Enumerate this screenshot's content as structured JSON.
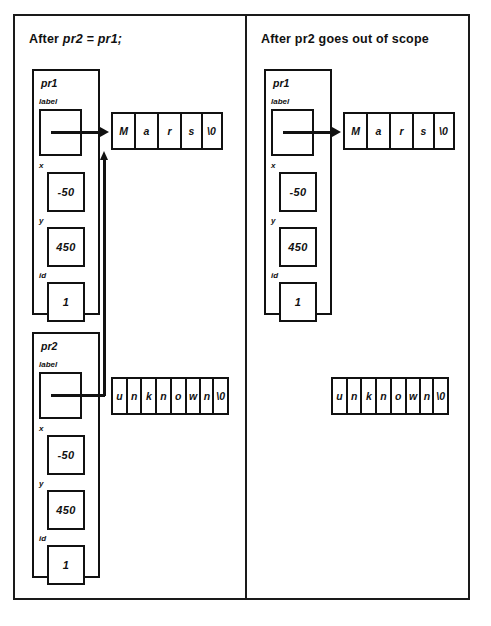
{
  "figure": {
    "type": "pointer-memory-diagram",
    "border_color": "#111111",
    "background": "#ffffff"
  },
  "panels": [
    {
      "id": "left",
      "title_prefix": "After ",
      "title_code": "pr2 = pr1;",
      "structs": [
        {
          "name": "pr1",
          "fields": [
            {
              "label": "label",
              "value": ""
            },
            {
              "label": "x",
              "value": "-50"
            },
            {
              "label": "y",
              "value": "450"
            },
            {
              "label": "id",
              "value": "1"
            }
          ]
        },
        {
          "name": "pr2",
          "fields": [
            {
              "label": "label",
              "value": ""
            },
            {
              "label": "x",
              "value": "-50"
            },
            {
              "label": "y",
              "value": "450"
            },
            {
              "label": "id",
              "value": "1"
            }
          ]
        }
      ],
      "arrays": [
        {
          "id": "mars",
          "cells": [
            "M",
            "a",
            "r",
            "s",
            "\\0"
          ]
        },
        {
          "id": "unknown",
          "cells": [
            "u",
            "n",
            "k",
            "n",
            "o",
            "w",
            "n",
            "\\0"
          ]
        }
      ],
      "connectors": [
        {
          "from": "pr1.label",
          "to": "mars",
          "style": "straight-right-arrow"
        },
        {
          "from": "pr2.label",
          "to": "mars",
          "style": "right-then-up-arrow"
        }
      ]
    },
    {
      "id": "right",
      "title_prefix": "After pr2 goes out of scope",
      "title_code": "",
      "structs": [
        {
          "name": "pr1",
          "fields": [
            {
              "label": "label",
              "value": ""
            },
            {
              "label": "x",
              "value": "-50"
            },
            {
              "label": "y",
              "value": "450"
            },
            {
              "label": "id",
              "value": "1"
            }
          ]
        }
      ],
      "arrays": [
        {
          "id": "mars",
          "cells": [
            "M",
            "a",
            "r",
            "s",
            "\\0"
          ]
        },
        {
          "id": "unknown",
          "cells": [
            "u",
            "n",
            "k",
            "n",
            "o",
            "w",
            "n",
            "\\0"
          ]
        }
      ],
      "connectors": [
        {
          "from": "pr1.label",
          "to": "mars",
          "style": "straight-right-arrow"
        }
      ]
    }
  ]
}
